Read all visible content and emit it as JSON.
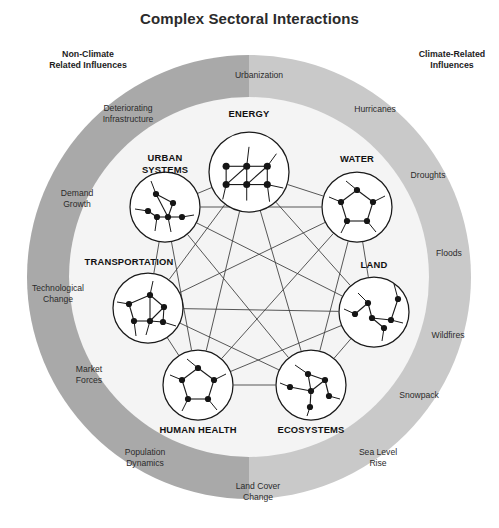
{
  "title": "Complex Sectoral Interactions",
  "colors": {
    "ring_left": "#a9a9a9",
    "ring_right": "#c9c9c9",
    "inner_disc": "#f4f4f4",
    "node_fill": "#ffffff",
    "stroke": "#1a1a1a",
    "link": "#3a3a3a",
    "text": "#231f20"
  },
  "headings": {
    "left": "Non-Climate\nRelated Influences",
    "left_line1": "Non-Climate",
    "left_line2": "Related Influences",
    "right": "Climate-Related\nInfluences",
    "right_line1": "Climate-Related",
    "right_line2": "Influences"
  },
  "sectors": [
    {
      "id": "energy",
      "label": "ENERGY",
      "label_line1": "ENERGY",
      "label_line2": "",
      "cx": 249,
      "cy": 172,
      "r": 40,
      "label_x": 249,
      "label_y": 117,
      "anchor": "middle",
      "pattern": "grid"
    },
    {
      "id": "water",
      "label": "WATER",
      "label_line1": "WATER",
      "label_line2": "",
      "cx": 357,
      "cy": 207,
      "r": 35,
      "label_x": 357,
      "label_y": 162,
      "anchor": "middle",
      "pattern": "pentagon"
    },
    {
      "id": "land",
      "label": "LAND",
      "label_line1": "LAND",
      "label_line2": "",
      "cx": 374,
      "cy": 312,
      "r": 35,
      "label_x": 374,
      "label_y": 268,
      "anchor": "middle",
      "pattern": "branch"
    },
    {
      "id": "ecosystems",
      "label": "ECOSYSTEMS",
      "label_line1": "ECOSYSTEMS",
      "label_line2": "",
      "cx": 311,
      "cy": 385,
      "r": 35,
      "label_x": 311,
      "label_y": 433,
      "anchor": "middle",
      "pattern": "star"
    },
    {
      "id": "human-health",
      "label": "HUMAN HEALTH",
      "label_line1": "HUMAN HEALTH",
      "label_line2": "",
      "cx": 198,
      "cy": 385,
      "r": 35,
      "label_x": 198,
      "label_y": 433,
      "anchor": "middle",
      "pattern": "pentagon"
    },
    {
      "id": "transportation",
      "label": "TRANSPORTATION",
      "label_line1": "TRANSPORTATION",
      "label_line2": "",
      "cx": 148,
      "cy": 308,
      "r": 35,
      "label_x": 129,
      "label_y": 265,
      "anchor": "middle",
      "pattern": "mesh"
    },
    {
      "id": "urban-systems",
      "label": "URBAN SYSTEMS",
      "label_line1": "URBAN",
      "label_line2": "SYSTEMS",
      "cx": 165,
      "cy": 207,
      "r": 35,
      "label_x": 165,
      "label_y": 161,
      "anchor": "middle",
      "pattern": "tree"
    }
  ],
  "ring_labels_left": [
    {
      "id": "deteriorating-infrastructure",
      "line1": "Deteriorating",
      "line2": "Infrastructure",
      "x": 128,
      "y": 111,
      "anchor": "middle"
    },
    {
      "id": "demand-growth",
      "line1": "Demand",
      "line2": "Growth",
      "x": 77,
      "y": 196,
      "anchor": "middle"
    },
    {
      "id": "technological-change",
      "line1": "Technological",
      "line2": "Change",
      "x": 58,
      "y": 291,
      "anchor": "middle"
    },
    {
      "id": "market-forces",
      "line1": "Market",
      "line2": "Forces",
      "x": 89,
      "y": 372,
      "anchor": "middle"
    },
    {
      "id": "population-dynamics",
      "line1": "Population",
      "line2": "Dynamics",
      "x": 145,
      "y": 455,
      "anchor": "middle"
    },
    {
      "id": "land-cover-change",
      "line1": "Land Cover",
      "line2": "Change",
      "x": 258,
      "y": 489,
      "anchor": "middle"
    },
    {
      "id": "urbanization",
      "line1": "Urbanization",
      "line2": "",
      "x": 259,
      "y": 78,
      "anchor": "middle"
    }
  ],
  "ring_labels_right": [
    {
      "id": "hurricanes",
      "line1": "Hurricanes",
      "line2": "",
      "x": 375,
      "y": 112,
      "anchor": "middle"
    },
    {
      "id": "droughts",
      "line1": "Droughts",
      "line2": "",
      "x": 428,
      "y": 178,
      "anchor": "middle"
    },
    {
      "id": "floods",
      "line1": "Floods",
      "line2": "",
      "x": 449,
      "y": 256,
      "anchor": "middle"
    },
    {
      "id": "wildfires",
      "line1": "Wildfires",
      "line2": "",
      "x": 448,
      "y": 338,
      "anchor": "middle"
    },
    {
      "id": "snowpack",
      "line1": "Snowpack",
      "line2": "",
      "x": 419,
      "y": 398,
      "anchor": "middle"
    },
    {
      "id": "sea-level-rise",
      "line1": "Sea Level",
      "line2": "Rise",
      "x": 378,
      "y": 455,
      "anchor": "middle"
    }
  ],
  "geometry": {
    "center_x": 249,
    "center_y": 277,
    "outer_radius": 222,
    "inner_radius": 180,
    "heading_left_x": 88,
    "heading_left_y": 57,
    "heading_right_x": 452,
    "heading_right_y": 57
  },
  "mini_networks": {
    "grid": {
      "dots": [
        [
          -20,
          -5
        ],
        [
          -2,
          -5
        ],
        [
          16,
          -5
        ],
        [
          -20,
          11
        ],
        [
          -2,
          11
        ],
        [
          16,
          11
        ]
      ],
      "edges": [
        [
          0,
          1
        ],
        [
          1,
          2
        ],
        [
          3,
          4
        ],
        [
          4,
          5
        ],
        [
          0,
          3
        ],
        [
          1,
          4
        ],
        [
          2,
          5
        ],
        [
          3,
          1
        ],
        [
          4,
          2
        ]
      ],
      "stubs": [
        [
          [
            -2,
            -5
          ],
          [
            0,
            -22
          ]
        ],
        [
          [
            16,
            11
          ],
          [
            30,
            14
          ]
        ],
        [
          [
            16,
            -5
          ],
          [
            24,
            -16
          ]
        ],
        [
          [
            -20,
            11
          ],
          [
            -23,
            24
          ]
        ],
        [
          [
            -2,
            11
          ],
          [
            -2,
            25
          ]
        ],
        [
          [
            16,
            11
          ],
          [
            18,
            26
          ]
        ]
      ]
    },
    "pentagon": {
      "dots": [
        [
          0,
          -17
        ],
        [
          16,
          -5
        ],
        [
          10,
          14
        ],
        [
          -10,
          14
        ],
        [
          -16,
          -5
        ]
      ],
      "edges": [
        [
          0,
          1
        ],
        [
          1,
          2
        ],
        [
          2,
          3
        ],
        [
          3,
          4
        ],
        [
          4,
          0
        ]
      ],
      "stubs": [
        [
          [
            0,
            -17
          ],
          [
            -11,
            -26
          ]
        ],
        [
          [
            16,
            -5
          ],
          [
            28,
            -11
          ]
        ],
        [
          [
            10,
            14
          ],
          [
            19,
            25
          ]
        ],
        [
          [
            -10,
            14
          ],
          [
            -16,
            26
          ]
        ],
        [
          [
            -16,
            -5
          ],
          [
            -28,
            -10
          ]
        ]
      ]
    },
    "branch": {
      "dots": [
        [
          -6,
          -9
        ],
        [
          -19,
          2
        ],
        [
          10,
          16
        ],
        [
          24,
          -13
        ],
        [
          17,
          8
        ],
        [
          -2,
          6
        ]
      ],
      "edges": [
        [
          0,
          1
        ],
        [
          0,
          5
        ],
        [
          5,
          4
        ],
        [
          4,
          3
        ],
        [
          5,
          2
        ]
      ],
      "stubs": [
        [
          [
            24,
            -13
          ],
          [
            20,
            -28
          ]
        ],
        [
          [
            -19,
            2
          ],
          [
            -30,
            -3
          ]
        ],
        [
          [
            10,
            16
          ],
          [
            8,
            29
          ]
        ],
        [
          [
            -6,
            -9
          ],
          [
            -16,
            -19
          ]
        ],
        [
          [
            17,
            8
          ],
          [
            29,
            11
          ]
        ]
      ]
    },
    "star": {
      "dots": [
        [
          -3,
          -11
        ],
        [
          -21,
          2
        ],
        [
          0,
          6
        ],
        [
          14,
          -5
        ],
        [
          18,
          11
        ],
        [
          -1,
          22
        ]
      ],
      "edges": [
        [
          0,
          2
        ],
        [
          1,
          2
        ],
        [
          2,
          3
        ],
        [
          3,
          4
        ],
        [
          2,
          5
        ],
        [
          0,
          3
        ]
      ],
      "stubs": [
        [
          [
            -3,
            -11
          ],
          [
            -16,
            -20
          ]
        ],
        [
          [
            -21,
            2
          ],
          [
            -31,
            -2
          ]
        ],
        [
          [
            18,
            11
          ],
          [
            29,
            14
          ]
        ],
        [
          [
            -1,
            22
          ],
          [
            -4,
            31
          ]
        ]
      ]
    },
    "mesh": {
      "dots": [
        [
          2,
          -13
        ],
        [
          -19,
          -4
        ],
        [
          16,
          -1
        ],
        [
          -14,
          13
        ],
        [
          2,
          13
        ],
        [
          15,
          14
        ]
      ],
      "edges": [
        [
          0,
          1
        ],
        [
          0,
          2
        ],
        [
          2,
          5
        ],
        [
          5,
          4
        ],
        [
          4,
          3
        ],
        [
          3,
          1
        ],
        [
          0,
          4
        ],
        [
          2,
          4
        ]
      ],
      "stubs": [
        [
          [
            2,
            -13
          ],
          [
            5,
            -27
          ]
        ],
        [
          [
            -19,
            -4
          ],
          [
            -31,
            -6
          ]
        ],
        [
          [
            15,
            14
          ],
          [
            28,
            18
          ]
        ],
        [
          [
            -14,
            13
          ],
          [
            -12,
            28
          ]
        ],
        [
          [
            2,
            13
          ],
          [
            -2,
            27
          ]
        ]
      ]
    },
    "tree": {
      "dots": [
        [
          -9,
          -13
        ],
        [
          8,
          -4
        ],
        [
          -17,
          4
        ],
        [
          -8,
          10
        ],
        [
          3,
          10
        ],
        [
          17,
          10
        ]
      ],
      "edges": [
        [
          0,
          1
        ],
        [
          1,
          4
        ],
        [
          0,
          4
        ],
        [
          2,
          3
        ],
        [
          3,
          4
        ],
        [
          4,
          5
        ]
      ],
      "stubs": [
        [
          [
            -9,
            -13
          ],
          [
            -14,
            -26
          ]
        ],
        [
          [
            -17,
            4
          ],
          [
            -30,
            2
          ]
        ],
        [
          [
            17,
            10
          ],
          [
            29,
            8
          ]
        ],
        [
          [
            3,
            10
          ],
          [
            6,
            25
          ]
        ],
        [
          [
            -8,
            10
          ],
          [
            -10,
            24
          ]
        ]
      ]
    }
  }
}
